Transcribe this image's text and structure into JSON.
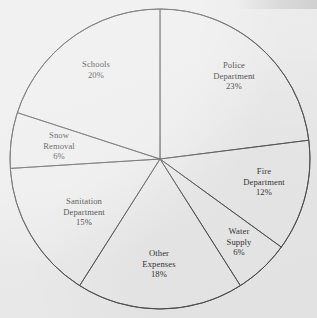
{
  "chart_data": {
    "type": "pie",
    "title": "",
    "subtitle": "",
    "xlabel": "",
    "ylabel": "",
    "legend_position": "none",
    "grid": false,
    "start_angle_deg": 0,
    "direction": "clockwise",
    "units": "percent",
    "total": 100,
    "categories": [
      "Police Department",
      "Fire Department",
      "Water Supply",
      "Other Expenses",
      "Sanitation Department",
      "Snow Removal",
      "Schools"
    ],
    "values": [
      23,
      12,
      6,
      18,
      15,
      6,
      20
    ],
    "slices": [
      {
        "name": "police-department",
        "lines": [
          "Police",
          "Department"
        ],
        "value": 23,
        "value_label": "23%",
        "start_pct": 0,
        "end_pct": 23,
        "label_x": 234,
        "label_y": 76
      },
      {
        "name": "fire-department",
        "lines": [
          "Fire",
          "Department"
        ],
        "value": 12,
        "value_label": "12%",
        "start_pct": 23,
        "end_pct": 35,
        "label_x": 264,
        "label_y": 182
      },
      {
        "name": "water-supply",
        "lines": [
          "Water",
          "Supply"
        ],
        "value": 6,
        "value_label": "6%",
        "start_pct": 35,
        "end_pct": 41,
        "label_x": 239,
        "label_y": 242
      },
      {
        "name": "other-expenses",
        "lines": [
          "Other",
          "Expenses"
        ],
        "value": 18,
        "value_label": "18%",
        "start_pct": 41,
        "end_pct": 59,
        "label_x": 159,
        "label_y": 264
      },
      {
        "name": "sanitation-department",
        "lines": [
          "Sanitation",
          "Department"
        ],
        "value": 15,
        "value_label": "15%",
        "start_pct": 59,
        "end_pct": 74,
        "label_x": 84,
        "label_y": 212
      },
      {
        "name": "snow-removal",
        "lines": [
          "Snow",
          "Removal"
        ],
        "value": 6,
        "value_label": "6%",
        "start_pct": 74,
        "end_pct": 80,
        "label_x": 59,
        "label_y": 146
      },
      {
        "name": "schools",
        "lines": [
          "Schools"
        ],
        "value": 20,
        "value_label": "20%",
        "start_pct": 80,
        "end_pct": 100,
        "label_x": 96,
        "label_y": 70
      }
    ],
    "geometry": {
      "center_x": 160,
      "center_y": 159,
      "radius": 150
    },
    "colors": {
      "background": "#ebebeb",
      "stroke": "#4a4a4a",
      "text": "#2e2e2e"
    }
  }
}
